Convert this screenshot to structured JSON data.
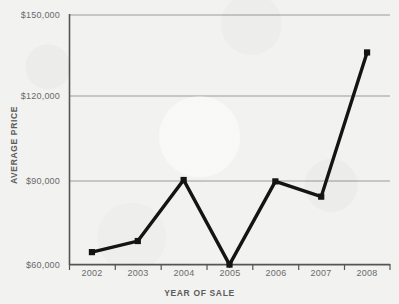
{
  "chart_data": {
    "type": "line",
    "title": "",
    "xlabel": "YEAR OF SALE",
    "ylabel": "AVERAGE PRICE",
    "categories": [
      "2002",
      "2003",
      "2004",
      "2005",
      "2006",
      "2007",
      "2008"
    ],
    "values": [
      64500,
      68500,
      90500,
      60000,
      90000,
      84500,
      136500
    ],
    "ytick_labels": [
      "$150,000",
      "$120,000",
      "$90,000",
      "$60,000"
    ],
    "ytick_values": [
      150000,
      120000,
      90000,
      60000
    ],
    "ylim": [
      60000,
      150000
    ],
    "grid": true,
    "legend": false,
    "marker": "square",
    "series": [
      {
        "name": "Average Price",
        "values": [
          64500,
          68500,
          90500,
          60000,
          90000,
          84500,
          136500
        ]
      }
    ],
    "colors": {
      "line": "#141414",
      "marker": "#141414",
      "grid": "#9a9a9a",
      "axis": "#555555",
      "text": "#6a6a6a",
      "background": "#f2f2f1"
    }
  }
}
